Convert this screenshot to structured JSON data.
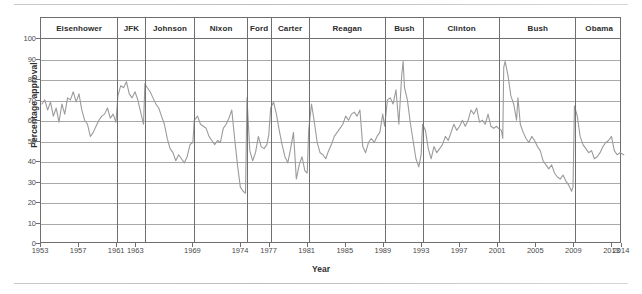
{
  "chart_data": {
    "type": "line",
    "title": "",
    "xlabel": "Year",
    "ylabel": "Percentage approval",
    "xlim": [
      1953,
      2014
    ],
    "ylim": [
      0,
      100
    ],
    "grid": true,
    "legend": "none",
    "line_color": "#9b9b9b",
    "axis_color": "#6f6f6f",
    "y_ticks": [
      100,
      90,
      80,
      70,
      60,
      50,
      40,
      30,
      20,
      10,
      0
    ],
    "x_ticks": [
      1953,
      1957,
      1961,
      1963,
      1969,
      1974,
      1977,
      1981,
      1985,
      1989,
      1993,
      1997,
      2001,
      2005,
      2009,
      2013,
      2014
    ],
    "x_tick_labels": [
      "1953",
      "1957",
      "1961",
      "1963",
      "1969",
      "1974",
      "1977",
      "1981",
      "1985",
      "1989",
      "1993",
      "1997",
      "2001",
      "2005",
      "2009",
      "2013",
      "2014"
    ],
    "annotations": {
      "president_bands": [
        {
          "label": "Eisenhower",
          "start": 1953.0,
          "end": 1961.0
        },
        {
          "label": "JFK",
          "start": 1961.0,
          "end": 1963.9
        },
        {
          "label": "Johnson",
          "start": 1963.9,
          "end": 1969.1
        },
        {
          "label": "Nixon",
          "start": 1969.1,
          "end": 1974.6
        },
        {
          "label": "Ford",
          "start": 1974.6,
          "end": 1977.1
        },
        {
          "label": "Carter",
          "start": 1977.1,
          "end": 1981.1
        },
        {
          "label": "Reagan",
          "start": 1981.1,
          "end": 1989.1
        },
        {
          "label": "Bush",
          "start": 1989.1,
          "end": 1993.1
        },
        {
          "label": "Clinton",
          "start": 1993.1,
          "end": 2001.1
        },
        {
          "label": "Bush",
          "start": 2001.1,
          "end": 2009.1
        },
        {
          "label": "Obama",
          "start": 2009.1,
          "end": 2014.5
        }
      ]
    },
    "series": [
      {
        "name": "Presidential approval",
        "color": "#9b9b9b",
        "x": [
          1953.1,
          1953.4,
          1953.7,
          1954.0,
          1954.3,
          1954.6,
          1954.9,
          1955.2,
          1955.5,
          1955.8,
          1956.1,
          1956.4,
          1956.7,
          1957.0,
          1957.3,
          1957.6,
          1957.9,
          1958.2,
          1958.5,
          1958.8,
          1959.1,
          1959.4,
          1959.7,
          1960.0,
          1960.3,
          1960.6,
          1960.9,
          1961.1,
          1961.4,
          1961.7,
          1962.0,
          1962.3,
          1962.6,
          1962.9,
          1963.2,
          1963.5,
          1963.8,
          1963.95,
          1964.2,
          1964.5,
          1964.8,
          1965.1,
          1965.4,
          1965.7,
          1966.0,
          1966.3,
          1966.6,
          1966.9,
          1967.2,
          1967.5,
          1967.8,
          1968.1,
          1968.4,
          1968.7,
          1969.0,
          1969.15,
          1969.5,
          1969.8,
          1970.1,
          1970.4,
          1970.7,
          1971.0,
          1971.3,
          1971.6,
          1971.9,
          1972.2,
          1972.5,
          1972.8,
          1973.1,
          1973.4,
          1973.7,
          1974.0,
          1974.3,
          1974.55,
          1974.7,
          1975.0,
          1975.3,
          1975.6,
          1975.9,
          1976.2,
          1976.5,
          1976.8,
          1977.0,
          1977.2,
          1977.5,
          1977.8,
          1978.1,
          1978.4,
          1978.7,
          1979.0,
          1979.3,
          1979.6,
          1979.9,
          1980.2,
          1980.5,
          1980.8,
          1981.05,
          1981.2,
          1981.5,
          1981.8,
          1982.1,
          1982.4,
          1982.7,
          1983.0,
          1983.3,
          1983.6,
          1983.9,
          1984.2,
          1984.5,
          1984.8,
          1985.1,
          1985.4,
          1985.7,
          1986.0,
          1986.3,
          1986.6,
          1986.9,
          1987.2,
          1987.5,
          1987.8,
          1988.1,
          1988.4,
          1988.7,
          1989.0,
          1989.2,
          1989.5,
          1989.8,
          1990.1,
          1990.4,
          1990.7,
          1991.0,
          1991.15,
          1991.3,
          1991.6,
          1991.9,
          1992.2,
          1992.5,
          1992.8,
          1993.05,
          1993.2,
          1993.5,
          1993.8,
          1994.1,
          1994.4,
          1994.7,
          1995.0,
          1995.3,
          1995.6,
          1995.9,
          1996.2,
          1996.5,
          1996.8,
          1997.1,
          1997.4,
          1997.7,
          1998.0,
          1998.3,
          1998.6,
          1998.9,
          1999.2,
          1999.5,
          1999.8,
          2000.1,
          2000.4,
          2000.7,
          2001.0,
          2001.2,
          2001.5,
          2001.65,
          2001.75,
          2001.9,
          2002.2,
          2002.5,
          2002.8,
          2003.1,
          2003.25,
          2003.5,
          2003.8,
          2004.1,
          2004.4,
          2004.7,
          2005.0,
          2005.3,
          2005.6,
          2005.9,
          2006.2,
          2006.5,
          2006.8,
          2007.1,
          2007.4,
          2007.7,
          2008.0,
          2008.3,
          2008.6,
          2008.9,
          2009.05,
          2009.2,
          2009.5,
          2009.8,
          2010.1,
          2010.4,
          2010.7,
          2011.0,
          2011.3,
          2011.6,
          2011.9,
          2012.2,
          2012.5,
          2012.8,
          2013.1,
          2013.4,
          2013.7,
          2014.0,
          2014.4
        ],
        "y": [
          68,
          70,
          65,
          69,
          62,
          66,
          59,
          68,
          63,
          71,
          70,
          74,
          69,
          73,
          65,
          60,
          58,
          52,
          54,
          57,
          60,
          62,
          63,
          66,
          61,
          63,
          59,
          72,
          77,
          76,
          79,
          73,
          71,
          74,
          70,
          64,
          58,
          78,
          76,
          74,
          71,
          68,
          66,
          62,
          58,
          51,
          46,
          44,
          40,
          43,
          41,
          39,
          42,
          48,
          49,
          60,
          62,
          58,
          57,
          56,
          52,
          50,
          48,
          50,
          49,
          56,
          58,
          61,
          65,
          51,
          38,
          27,
          25,
          24,
          71,
          45,
          40,
          44,
          52,
          47,
          46,
          48,
          53,
          66,
          69,
          63,
          55,
          48,
          42,
          39,
          46,
          54,
          31,
          38,
          42,
          35,
          34,
          55,
          68,
          59,
          49,
          44,
          43,
          41,
          45,
          48,
          52,
          54,
          56,
          58,
          62,
          60,
          63,
          64,
          62,
          65,
          47,
          44,
          49,
          51,
          49,
          52,
          54,
          63,
          57,
          70,
          71,
          68,
          75,
          58,
          82,
          89,
          76,
          70,
          59,
          50,
          41,
          37,
          43,
          58,
          55,
          46,
          41,
          47,
          44,
          46,
          48,
          52,
          50,
          54,
          58,
          55,
          57,
          60,
          57,
          60,
          65,
          63,
          66,
          59,
          60,
          58,
          63,
          57,
          56,
          57,
          56,
          55,
          51,
          86,
          89,
          82,
          72,
          68,
          60,
          71,
          58,
          54,
          51,
          49,
          52,
          50,
          47,
          45,
          40,
          38,
          36,
          38,
          34,
          32,
          31,
          33,
          30,
          28,
          25,
          27,
          67,
          62,
          52,
          48,
          46,
          44,
          45,
          41,
          42,
          44,
          47,
          49,
          50,
          52,
          45,
          43,
          44,
          43
        ]
      }
    ]
  },
  "axes": {
    "y_title": "Percentage approval",
    "x_title": "Year"
  }
}
